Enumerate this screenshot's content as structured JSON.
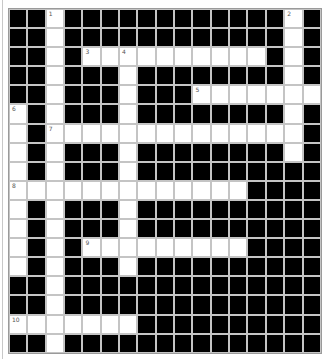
{
  "puzzle": {
    "rows": 18,
    "cols": 17,
    "colors": {
      "block": "#000000",
      "open": "#ffffff",
      "gridline": "#c4c4c4"
    },
    "grid": [
      "##.############.#",
      "##.############.#",
      "##.#..........#.#",
      "##.###.########.#",
      "##.###.###.......",
      ".#.###.########.#",
      ".#..............#",
      ".#.###.########.#",
      ".#.###.##########",
      ".............####",
      ".#.###.##########",
      ".#.###.##########",
      ".#.#.........####",
      ".#.###.##########",
      "##.##############",
      "##.##############",
      ".......##########",
      "##.##############"
    ],
    "numbers": [
      {
        "row": 0,
        "col": 2,
        "n": "1"
      },
      {
        "row": 0,
        "col": 15,
        "n": "2"
      },
      {
        "row": 2,
        "col": 4,
        "n": "3"
      },
      {
        "row": 2,
        "col": 6,
        "n": "4"
      },
      {
        "row": 4,
        "col": 10,
        "n": "5"
      },
      {
        "row": 5,
        "col": 0,
        "n": "6"
      },
      {
        "row": 6,
        "col": 2,
        "n": "7"
      },
      {
        "row": 9,
        "col": 0,
        "n": "8"
      },
      {
        "row": 12,
        "col": 4,
        "n": "9"
      },
      {
        "row": 16,
        "col": 0,
        "n": "10"
      }
    ]
  }
}
